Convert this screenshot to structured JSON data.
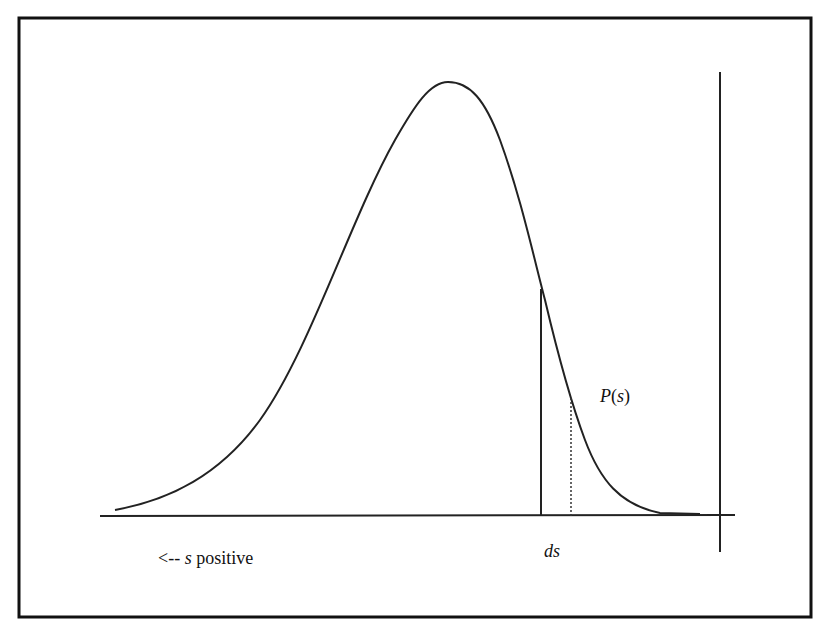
{
  "diagram": {
    "type": "probability-density-curve",
    "labels": {
      "direction": "<-- s positive",
      "direction_arrow": "<--",
      "direction_var": "s",
      "direction_word": "positive",
      "interval": "ds",
      "curve": "P(s)",
      "curve_fn": "P",
      "curve_arg": "s"
    },
    "colors": {
      "line": "#222222",
      "frame": "#111111",
      "background": "#ffffff"
    }
  }
}
